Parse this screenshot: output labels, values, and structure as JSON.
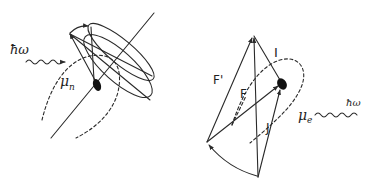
{
  "figure": {
    "colors": {
      "ink": "#2a2a2a",
      "background": "#ffffff"
    }
  },
  "left_panel": {
    "photon_label": "ħω",
    "moment_label": "μ",
    "moment_subscript": "n",
    "elements": [
      "photon-wavy-arrow",
      "spin-axis-line",
      "precession-cone",
      "precession-ellipses",
      "nucleus-dot",
      "dipole-field-lines-dashed"
    ]
  },
  "right_panel": {
    "labels": {
      "F_prime": "F'",
      "F": "F",
      "I": "I",
      "J": "J",
      "moment_label": "μ",
      "moment_subscript": "e",
      "photon_label": "ħω"
    },
    "elements": [
      "vector-F-prime",
      "vector-F",
      "vector-I",
      "vector-J",
      "curved-transition-arrow",
      "nucleus-dot",
      "dipole-field-lines-dashed",
      "photon-wavy-line"
    ]
  }
}
